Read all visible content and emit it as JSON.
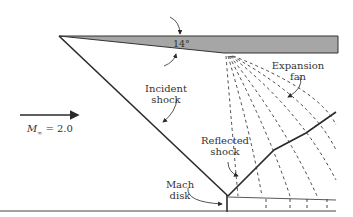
{
  "diagram": {
    "wedge_angle": "14°",
    "mach_symbol": "M",
    "mach_subscript": "∞",
    "mach_value": "= 2.0",
    "labels": {
      "incident_shock_line1": "Incident",
      "incident_shock_line2": "shock",
      "expansion_fan_line1": "Expansion",
      "expansion_fan_line2": "fan",
      "reflected_shock_line1": "Reflected",
      "reflected_shock_line2": "shock",
      "mach_disk_line1": "Mach",
      "mach_disk_line2": "disk"
    },
    "colors": {
      "wedge_fill": "#a6a6a6",
      "line": "#2a2a2a"
    }
  }
}
